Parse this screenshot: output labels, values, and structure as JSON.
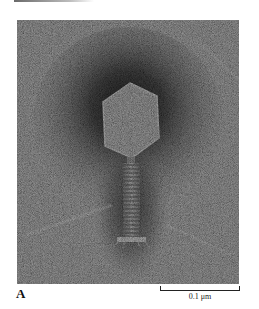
{
  "figure": {
    "panel_label": "A",
    "scale_bar": {
      "label": "0.1 μm"
    },
    "image": {
      "subject": "electron-micrograph-bacteriophage",
      "parts": [
        "hexagonal-capsid-head",
        "contractile-tail-sheath",
        "baseplate"
      ],
      "colors": {
        "background_stain": "#8c8c8c",
        "dark_halo": "#2e2e2e",
        "head_interior": "#a8a8a8",
        "page": "#ffffff"
      }
    }
  }
}
